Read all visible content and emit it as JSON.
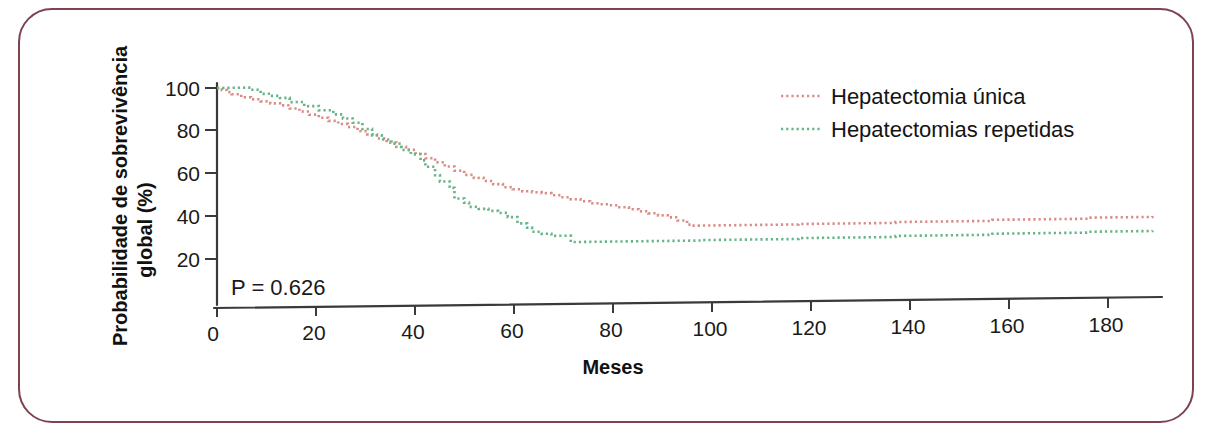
{
  "figure": {
    "frame_color": "#7d4450",
    "background": "#ffffff"
  },
  "annotations": {
    "p_value": "P = 0.626"
  },
  "legend": {
    "position": "top-right",
    "items": [
      {
        "label": "Hepatectomia única",
        "color": "#d98b84"
      },
      {
        "label": "Hepatectomias repetidas",
        "color": "#66b488"
      }
    ]
  },
  "chart_data": {
    "type": "line",
    "subtype": "kaplan-meier-survival",
    "title": "",
    "subtitle": "",
    "xlabel": "Meses",
    "ylabel": "Probabilidade de sobrevivência global (%)",
    "ylabel_lines": [
      "Probabilidade de sobrevivência",
      "global (%)"
    ],
    "xlim": [
      0,
      195
    ],
    "ylim": [
      0,
      105
    ],
    "xticks": [
      0,
      20,
      40,
      60,
      80,
      100,
      120,
      140,
      160,
      180
    ],
    "yticks": [
      20,
      40,
      60,
      80,
      100
    ],
    "xtick_labels": [
      "0",
      "20",
      "40",
      "60",
      "80",
      "100",
      "120",
      "140",
      "160",
      "180"
    ],
    "ytick_labels": [
      "20",
      "40",
      "60",
      "80",
      "100"
    ],
    "grid": false,
    "legend_position": "top-right",
    "annotations": [
      "P = 0.626"
    ],
    "series": [
      {
        "name": "Hepatectomia única",
        "color": "#d98b84",
        "linestyle": "dotted",
        "x": [
          0,
          1,
          2,
          3,
          5,
          7,
          9,
          11,
          13,
          15,
          17,
          19,
          21,
          23,
          25,
          27,
          29,
          31,
          33,
          35,
          37,
          39,
          41,
          43,
          45,
          47,
          49,
          51,
          53,
          55,
          57,
          59,
          61,
          63,
          65,
          67,
          69,
          71,
          73,
          75,
          77,
          79,
          81,
          83,
          85,
          87,
          89,
          91,
          93,
          95,
          97,
          98,
          105,
          120,
          140,
          160,
          180,
          193
        ],
        "values": [
          100,
          99,
          98,
          97,
          95.5,
          94.5,
          93.5,
          92.5,
          91.5,
          90,
          88.5,
          87,
          85.5,
          84,
          82.5,
          81,
          79,
          77.5,
          75.5,
          73.5,
          71.5,
          70,
          68,
          66,
          64,
          62,
          60,
          58,
          56.5,
          55,
          53.5,
          52,
          51,
          50,
          49.5,
          49,
          48,
          47,
          46,
          45,
          44,
          43.5,
          43,
          42,
          41,
          40,
          39,
          38,
          37,
          35.5,
          33.5,
          33,
          33,
          33.2,
          33.6,
          34.1,
          34.6,
          35
        ]
      },
      {
        "name": "Hepatectomias repetidas",
        "color": "#66b488",
        "linestyle": "dotted",
        "x": [
          0,
          4,
          7,
          9,
          11,
          13,
          15,
          18,
          21,
          24,
          26,
          28,
          30,
          32,
          34,
          36,
          38,
          40,
          42,
          43,
          45,
          46,
          48,
          49,
          51,
          52,
          54,
          56,
          58,
          60,
          62,
          64,
          65,
          67,
          69,
          71,
          73,
          80,
          100,
          120,
          140,
          160,
          180,
          193
        ],
        "values": [
          100,
          100,
          99,
          97,
          96,
          95,
          93,
          91,
          89,
          87,
          85,
          83,
          80,
          77,
          75,
          73,
          70,
          68,
          65,
          62,
          58,
          55,
          52,
          47,
          45,
          43,
          42,
          41,
          40,
          38,
          35,
          33,
          31,
          30,
          29,
          29,
          26,
          26,
          26.2,
          26.6,
          27.1,
          27.6,
          28,
          28.2
        ]
      }
    ]
  }
}
